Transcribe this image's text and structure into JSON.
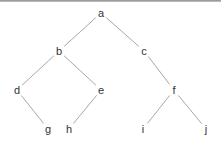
{
  "diagram": {
    "type": "binary-tree",
    "nodes": [
      {
        "id": "a",
        "label": "a",
        "x": 101,
        "y": 13
      },
      {
        "id": "b",
        "label": "b",
        "x": 59,
        "y": 51
      },
      {
        "id": "c",
        "label": "c",
        "x": 144,
        "y": 51
      },
      {
        "id": "d",
        "label": "d",
        "x": 17,
        "y": 90
      },
      {
        "id": "e",
        "label": "e",
        "x": 101,
        "y": 90
      },
      {
        "id": "f",
        "label": "f",
        "x": 174,
        "y": 90
      },
      {
        "id": "g",
        "label": "g",
        "x": 48,
        "y": 129
      },
      {
        "id": "h",
        "label": "h",
        "x": 69,
        "y": 129
      },
      {
        "id": "i",
        "label": "i",
        "x": 143,
        "y": 129
      },
      {
        "id": "j",
        "label": "j",
        "x": 206,
        "y": 129
      }
    ],
    "edges": [
      {
        "from": "a",
        "to": "b"
      },
      {
        "from": "a",
        "to": "c"
      },
      {
        "from": "b",
        "to": "d"
      },
      {
        "from": "b",
        "to": "e"
      },
      {
        "from": "c",
        "to": "f"
      },
      {
        "from": "d",
        "to": "g"
      },
      {
        "from": "e",
        "to": "h"
      },
      {
        "from": "f",
        "to": "i"
      },
      {
        "from": "f",
        "to": "j"
      }
    ],
    "colors": {
      "edge": "#a8a8a8",
      "label": "#333333",
      "top_border": "#8a8a8a"
    }
  }
}
